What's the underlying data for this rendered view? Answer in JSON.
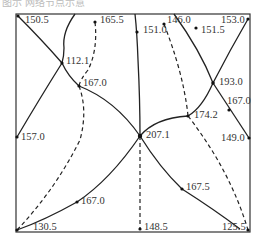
{
  "caption": "图示 网络节点示意",
  "colors": {
    "line": "#222222",
    "frame": "#333333",
    "text": "#333333",
    "background": "#ffffff"
  },
  "nodes": [
    {
      "id": "n1",
      "value": "150.5",
      "x": 18,
      "y": 16,
      "lx": 25,
      "ly": 15
    },
    {
      "id": "n2",
      "value": "165.5",
      "x": 95,
      "y": 22,
      "lx": 100,
      "ly": 15
    },
    {
      "id": "n3",
      "value": "151.0",
      "x": 137,
      "y": 32,
      "lx": 143,
      "ly": 25
    },
    {
      "id": "n4",
      "value": "146.0",
      "x": 164,
      "y": 24,
      "lx": 167,
      "ly": 15
    },
    {
      "id": "n5",
      "value": "151.5",
      "x": 196,
      "y": 28,
      "lx": 201,
      "ly": 25
    },
    {
      "id": "n6",
      "value": "153.0",
      "x": 248,
      "y": 19,
      "lx": 222,
      "ly": 15
    },
    {
      "id": "n7",
      "value": "112.1",
      "x": 62,
      "y": 63,
      "lx": 66,
      "ly": 56
    },
    {
      "id": "n8",
      "value": "167.0",
      "x": 79,
      "y": 86,
      "lx": 83,
      "ly": 78
    },
    {
      "id": "n9",
      "value": "193.0",
      "x": 213,
      "y": 83,
      "lx": 219,
      "ly": 77
    },
    {
      "id": "n10",
      "value": "167.0",
      "x": 229,
      "y": 110,
      "lx": 226,
      "ly": 96
    },
    {
      "id": "n11",
      "value": "174.2",
      "x": 188,
      "y": 116,
      "lx": 194,
      "ly": 110
    },
    {
      "id": "n12",
      "value": "157.0",
      "x": 17,
      "y": 137,
      "lx": 21,
      "ly": 132
    },
    {
      "id": "n13",
      "value": "207.1",
      "x": 140,
      "y": 136,
      "lx": 146,
      "ly": 130
    },
    {
      "id": "n14",
      "value": "149.0",
      "x": 249,
      "y": 138,
      "lx": 222,
      "ly": 133
    },
    {
      "id": "n15",
      "value": "167.5",
      "x": 182,
      "y": 189,
      "lx": 186,
      "ly": 182
    },
    {
      "id": "n16",
      "value": "167.0",
      "x": 77,
      "y": 202,
      "lx": 81,
      "ly": 196
    },
    {
      "id": "n17",
      "value": "130.5",
      "x": 17,
      "y": 230,
      "lx": 33,
      "ly": 222
    },
    {
      "id": "n18",
      "value": "148.5",
      "x": 140,
      "y": 229,
      "lx": 144,
      "ly": 222
    },
    {
      "id": "n19",
      "value": "125.5",
      "x": 248,
      "y": 230,
      "lx": 222,
      "ly": 222
    }
  ],
  "frame": {
    "x": 16,
    "y": 14,
    "width": 234,
    "height": 218
  }
}
